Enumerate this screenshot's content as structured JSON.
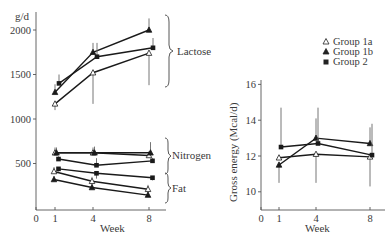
{
  "chart_data": [
    {
      "type": "line",
      "id": "left",
      "title": "",
      "xlabel": "Week",
      "ylabel": "g/d",
      "xlim": [
        0,
        9
      ],
      "ylim": [
        0,
        2150
      ],
      "xticks": [
        0,
        1,
        4,
        8
      ],
      "yticks": [
        500,
        1000,
        1500,
        2000
      ],
      "grid": false,
      "groups_brackets": [
        "Lactose",
        "Nitrogen",
        "Fat"
      ],
      "x": [
        1,
        4,
        8
      ],
      "series": [
        {
          "name": "Lactose - Group 1a",
          "group": "Group 1a",
          "component": "Lactose",
          "marker": "open-triangle",
          "values": [
            1170,
            1520,
            1740
          ],
          "err_dir": "down",
          "err": [
            1100,
            1170,
            1380
          ]
        },
        {
          "name": "Lactose - Group 1b",
          "group": "Group 1b",
          "component": "Lactose",
          "marker": "filled-triangle",
          "values": [
            1300,
            1750,
            2000
          ],
          "err_dir": "up",
          "err": [
            1390,
            1855,
            2130
          ]
        },
        {
          "name": "Lactose - Group 2",
          "group": "Group 2",
          "component": "Lactose",
          "marker": "square",
          "values": [
            1400,
            1700,
            1800
          ],
          "err_dir": "up",
          "err": [
            1500,
            1855,
            1910
          ]
        },
        {
          "name": "Nitrogen - Group 1a",
          "group": "Group 1a",
          "component": "Nitrogen",
          "marker": "open-triangle",
          "values": [
            620,
            620,
            590
          ],
          "err_dir": "up",
          "err": [
            680,
            680,
            640
          ]
        },
        {
          "name": "Nitrogen - Group 1b",
          "group": "Group 1b",
          "component": "Nitrogen",
          "marker": "filled-triangle",
          "values": [
            620,
            620,
            620
          ],
          "err_dir": "up",
          "err": [
            680,
            690,
            740
          ]
        },
        {
          "name": "Nitrogen - Group 2",
          "group": "Group 2",
          "component": "Nitrogen",
          "marker": "square",
          "values": [
            550,
            480,
            530
          ],
          "err_dir": "up",
          "err": [
            580,
            560,
            560
          ]
        },
        {
          "name": "Fat - Group 1a",
          "group": "Group 1a",
          "component": "Fat",
          "marker": "open-triangle",
          "values": [
            410,
            300,
            210
          ],
          "err_dir": "up",
          "err": [
            460,
            350,
            260
          ]
        },
        {
          "name": "Fat - Group 1b",
          "group": "Group 1b",
          "component": "Fat",
          "marker": "filled-triangle",
          "values": [
            320,
            230,
            145
          ],
          "err_dir": "up",
          "err": [
            360,
            270,
            180
          ]
        },
        {
          "name": "Fat - Group 2",
          "group": "Group 2",
          "component": "Fat",
          "marker": "square",
          "values": [
            440,
            390,
            340
          ],
          "err_dir": "down",
          "err": [
            410,
            330,
            310
          ]
        }
      ]
    },
    {
      "type": "line",
      "id": "right",
      "title": "",
      "xlabel": "Week",
      "ylabel": "Gross energy (Mcal/d)",
      "xlim": [
        0,
        9
      ],
      "ylim": [
        9,
        16.5
      ],
      "xticks": [
        0,
        1,
        4,
        8
      ],
      "yticks": [
        10,
        12,
        14,
        16
      ],
      "grid": false,
      "x": [
        1,
        4,
        8
      ],
      "series": [
        {
          "name": "Group 1a",
          "marker": "open-triangle",
          "values": [
            11.9,
            12.1,
            11.95
          ],
          "err_dir": "down",
          "err": [
            11.9,
            10.5,
            10.3
          ]
        },
        {
          "name": "Group 1b",
          "marker": "filled-triangle",
          "values": [
            11.5,
            13.0,
            12.7
          ],
          "err_dir": "mixed",
          "err_up": [
            null,
            14.1,
            13.6
          ],
          "err_down": [
            10.5,
            null,
            null
          ]
        },
        {
          "name": "Group 2",
          "marker": "square",
          "values": [
            12.5,
            12.7,
            12.05
          ],
          "err_dir": "up",
          "err": [
            14.7,
            14.7,
            13.8
          ]
        }
      ]
    }
  ],
  "legend": {
    "position": "upper-right",
    "items": [
      {
        "label": "Group 1a",
        "marker": "open-triangle"
      },
      {
        "label": "Group 1b",
        "marker": "filled-triangle"
      },
      {
        "label": "Group 2",
        "marker": "square"
      }
    ]
  },
  "labels": {
    "left_unit": "g/d",
    "left_xlabel": "Week",
    "right_xlabel": "Week",
    "right_ylabel": "Gross energy (Mcal/d)",
    "lactose": "Lactose",
    "nitrogen": "Nitrogen",
    "fat": "Fat"
  },
  "colors": {
    "ink": "#1a1a1a",
    "axis": "#555555",
    "text": "#3a3a3a",
    "errorbar": "#666666"
  }
}
